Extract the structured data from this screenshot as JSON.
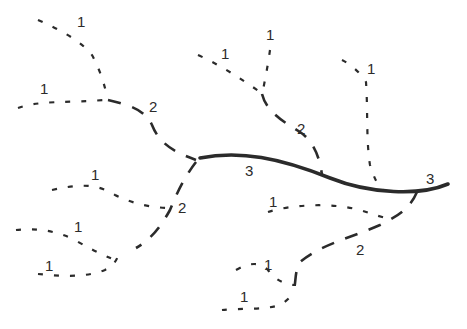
{
  "diagram": {
    "type": "stream-order-network",
    "colors": {
      "stroke": "#2b2b2b",
      "background": "#ffffff"
    },
    "legend_styles": {
      "order_1": "sparse dotted line",
      "order_2": "dashed line",
      "order_3": "thick solid line"
    },
    "labels": [
      {
        "id": "l1a",
        "text": "1",
        "x": 77,
        "y": 27
      },
      {
        "id": "l1b",
        "text": "1",
        "x": 40,
        "y": 94
      },
      {
        "id": "l2a",
        "text": "2",
        "x": 149,
        "y": 112
      },
      {
        "id": "l1c",
        "text": "1",
        "x": 221,
        "y": 59
      },
      {
        "id": "l1d",
        "text": "1",
        "x": 266,
        "y": 40
      },
      {
        "id": "l2b",
        "text": "2",
        "x": 297,
        "y": 134
      },
      {
        "id": "l1e",
        "text": "1",
        "x": 367,
        "y": 74
      },
      {
        "id": "l3a",
        "text": "3",
        "x": 245,
        "y": 176
      },
      {
        "id": "l3b",
        "text": "3",
        "x": 426,
        "y": 184
      },
      {
        "id": "l1f",
        "text": "1",
        "x": 91,
        "y": 180
      },
      {
        "id": "l2c",
        "text": "2",
        "x": 178,
        "y": 213
      },
      {
        "id": "l1g",
        "text": "1",
        "x": 74,
        "y": 232
      },
      {
        "id": "l1h",
        "text": "1",
        "x": 45,
        "y": 271
      },
      {
        "id": "l1i",
        "text": "1",
        "x": 269,
        "y": 207
      },
      {
        "id": "l2d",
        "text": "2",
        "x": 356,
        "y": 255
      },
      {
        "id": "l1j",
        "text": "1",
        "x": 264,
        "y": 270
      },
      {
        "id": "l1k",
        "text": "1",
        "x": 240,
        "y": 302
      }
    ]
  }
}
